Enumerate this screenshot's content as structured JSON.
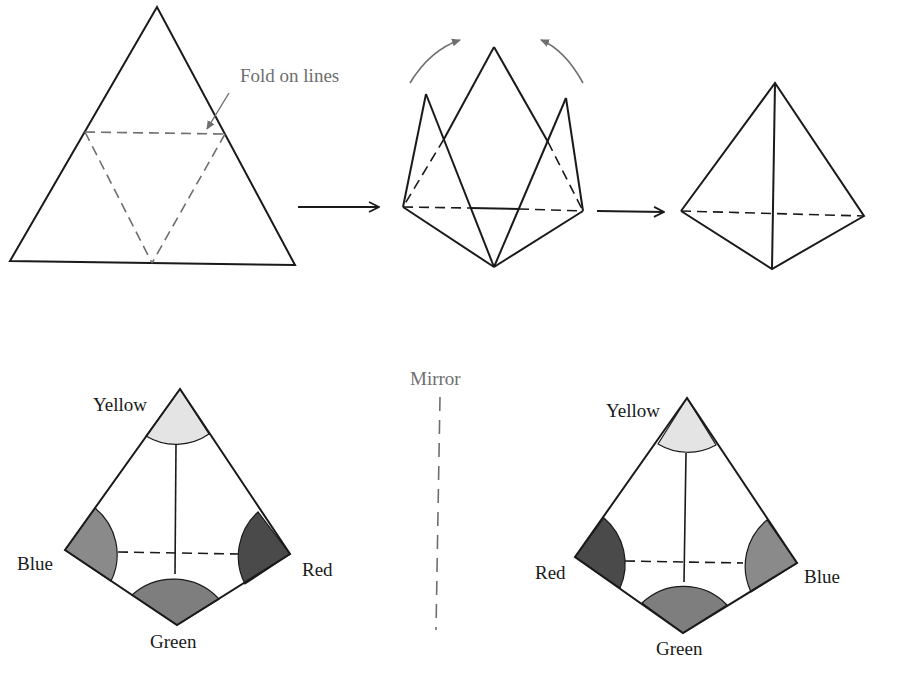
{
  "top_row": {
    "flat_net": {
      "annotation": "Fold on lines"
    },
    "step_arrows": [
      "arrow-1",
      "arrow-2"
    ]
  },
  "bottom_row": {
    "mirror_label": "Mirror",
    "left_tetrahedron": {
      "top": "Yellow",
      "left": "Blue",
      "right": "Red",
      "bottom": "Green"
    },
    "right_tetrahedron": {
      "top": "Yellow",
      "left": "Red",
      "right": "Blue",
      "bottom": "Green"
    }
  },
  "colors": {
    "yellow_cap": "#e4e4e4",
    "blue_cap": "#8a8a8a",
    "green_cap": "#7e7e7e",
    "red_cap": "#4a4a4a",
    "outline": "#1a1a1a",
    "guide_grey": "#6e6e6e"
  }
}
